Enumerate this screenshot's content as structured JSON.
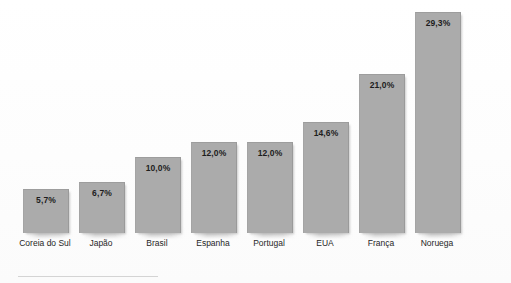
{
  "chart_data": {
    "type": "bar",
    "title": "",
    "subtitle": "",
    "xlabel": "",
    "ylabel": "",
    "categories": [
      "Coreia do Sul",
      "Japão",
      "Brasil",
      "Espanha",
      "Portugal",
      "EUA",
      "França",
      "Noruega"
    ],
    "values": [
      5.7,
      6.7,
      10.0,
      12.0,
      12.0,
      14.6,
      21.0,
      29.3
    ],
    "value_labels": [
      "5,7%",
      "6,7%",
      "10,0%",
      "12,0%",
      "12,0%",
      "14,6%",
      "21,0%",
      "29,3%"
    ],
    "ylim": [
      0,
      29.3
    ],
    "grid": false,
    "legend": null,
    "legend_position": "none",
    "axis_visible": false,
    "label_position": "inside-top",
    "orientation": "vertical",
    "series": [
      {
        "name": "",
        "values": [
          5.7,
          6.7,
          10.0,
          12.0,
          12.0,
          14.6,
          21.0,
          29.3
        ]
      }
    ]
  },
  "style": {
    "bar_color": "#ababab",
    "bar_border_color": "#9d9d9d",
    "value_text_color": "#1d1d1d",
    "category_text_color": "#262626",
    "background_color": "#fefefe"
  },
  "layout": {
    "bar_width_px": 44,
    "bar_pitch_px": 56,
    "first_bar_left_px": 23,
    "baseline_y_px": 233,
    "max_bar_height_px": 220
  }
}
